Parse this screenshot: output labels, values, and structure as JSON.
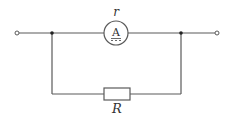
{
  "diagram": {
    "type": "circuit",
    "colors": {
      "wire": "#5a5a5a",
      "text": "#333333",
      "background": "#ffffff"
    },
    "terminals": [
      {
        "id": "left-terminal",
        "x": 17,
        "y": 33
      },
      {
        "id": "right-terminal",
        "x": 217,
        "y": 33
      }
    ],
    "junctions": [
      {
        "id": "left-junction",
        "x": 52,
        "y": 33
      },
      {
        "id": "right-junction",
        "x": 181,
        "y": 33
      }
    ],
    "ammeter": {
      "symbol_letter": "A",
      "label": "r",
      "cx": 116,
      "cy": 33,
      "radius": 12
    },
    "resistor": {
      "label": "R",
      "x": 104,
      "y": 88,
      "width": 26,
      "height": 12
    },
    "bottom_branch_y": 94
  }
}
